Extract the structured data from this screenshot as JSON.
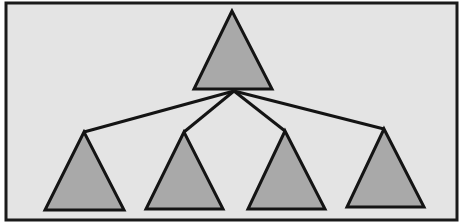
{
  "diagram": {
    "type": "tree",
    "colors": {
      "background": "#e4e4e4",
      "frame": "#1a1a1a",
      "node_fill": "#a9a9a9",
      "node_stroke": "#141414",
      "edge": "#141414"
    },
    "frame": {
      "x": 6,
      "y": 3,
      "w": 451,
      "h": 217
    },
    "root": {
      "id": "root",
      "shape": "triangle",
      "points": [
        [
          232,
          11
        ],
        [
          194,
          89
        ],
        [
          272,
          89
        ]
      ],
      "hub": [
        234,
        91
      ]
    },
    "children": [
      {
        "id": "child-1",
        "shape": "triangle",
        "points": [
          [
            84,
            132
          ],
          [
            45,
            210
          ],
          [
            124,
            210
          ]
        ]
      },
      {
        "id": "child-2",
        "shape": "triangle",
        "points": [
          [
            184,
            132
          ],
          [
            146,
            209
          ],
          [
            223,
            209
          ]
        ]
      },
      {
        "id": "child-3",
        "shape": "triangle",
        "points": [
          [
            285,
            131
          ],
          [
            248,
            209
          ],
          [
            325,
            209
          ]
        ]
      },
      {
        "id": "child-4",
        "shape": "triangle",
        "points": [
          [
            384,
            129
          ],
          [
            347,
            207
          ],
          [
            424,
            207
          ]
        ]
      }
    ]
  }
}
